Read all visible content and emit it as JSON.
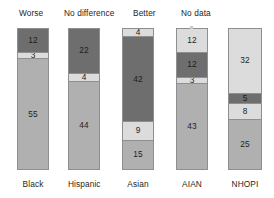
{
  "legend": {
    "items": [
      {
        "label": "Worse",
        "key": "worse",
        "color": "#6e6e6e",
        "left": 19
      },
      {
        "label": "No difference",
        "key": "no_difference",
        "color": "#b0b0b0",
        "left": 64
      },
      {
        "label": "Better",
        "key": "better",
        "color": "#dcdcdc",
        "left": 133
      },
      {
        "label": "No data",
        "key": "no_data",
        "color": "#dcdcdc",
        "left": 181
      }
    ]
  },
  "chart_data": {
    "type": "bar",
    "title": "",
    "xlabel": "",
    "ylabel": "",
    "stacked": true,
    "grid": false,
    "legend_position": "top",
    "ylim": [
      0,
      70
    ],
    "categories": [
      "Black",
      "Hispanic",
      "Asian",
      "AIAN",
      "NHOPI"
    ],
    "series": [
      {
        "name": "Worse",
        "values": [
          12,
          22,
          42,
          12,
          5
        ]
      },
      {
        "name": "No difference",
        "values": [
          55,
          44,
          15,
          43,
          25
        ]
      },
      {
        "name": "Better",
        "values": [
          3,
          4,
          9,
          3,
          8
        ]
      },
      {
        "name": "No data",
        "values": [
          0,
          0,
          4,
          12,
          32
        ]
      }
    ],
    "bars": [
      {
        "category": "Black",
        "left": 17,
        "width": 32,
        "total": 70,
        "segments": [
          {
            "value": 12,
            "label": "12",
            "shade": "dark",
            "series": "Worse"
          },
          {
            "value": 3,
            "label": "3",
            "shade": "light",
            "series": "Better"
          },
          {
            "value": 55,
            "label": "55",
            "shade": "medium",
            "series": "No difference"
          }
        ]
      },
      {
        "category": "Hispanic",
        "left": 68,
        "width": 32,
        "total": 70,
        "segments": [
          {
            "value": 22,
            "label": "22",
            "shade": "dark",
            "series": "Worse"
          },
          {
            "value": 4,
            "label": "4",
            "shade": "light",
            "series": "Better"
          },
          {
            "value": 44,
            "label": "44",
            "shade": "medium",
            "series": "No difference"
          }
        ]
      },
      {
        "category": "Asian",
        "left": 122,
        "width": 32,
        "total": 70,
        "segments": [
          {
            "value": 4,
            "label": "4",
            "shade": "light",
            "series": "No data"
          },
          {
            "value": 42,
            "label": "42",
            "shade": "dark",
            "series": "Worse"
          },
          {
            "value": 9,
            "label": "9",
            "shade": "light",
            "series": "Better"
          },
          {
            "value": 15,
            "label": "15",
            "shade": "medium",
            "series": "No difference"
          }
        ]
      },
      {
        "category": "AIAN",
        "left": 176,
        "width": 32,
        "total": 70,
        "segments": [
          {
            "value": 12,
            "label": "12",
            "shade": "light",
            "series": "No data"
          },
          {
            "value": 12,
            "label": "12",
            "shade": "dark",
            "series": "Worse"
          },
          {
            "value": 3,
            "label": "3",
            "shade": "light",
            "series": "Better"
          },
          {
            "value": 43,
            "label": "43",
            "shade": "medium",
            "series": "No difference"
          }
        ]
      },
      {
        "category": "NHOPI",
        "left": 228,
        "width": 34,
        "total": 70,
        "segments": [
          {
            "value": 32,
            "label": "32",
            "shade": "light",
            "series": "No data"
          },
          {
            "value": 5,
            "label": "5",
            "shade": "dark",
            "series": "Worse"
          },
          {
            "value": 8,
            "label": "8",
            "shade": "light",
            "series": "Better"
          },
          {
            "value": 25,
            "label": "25",
            "shade": "medium",
            "series": "No difference"
          }
        ]
      }
    ]
  }
}
